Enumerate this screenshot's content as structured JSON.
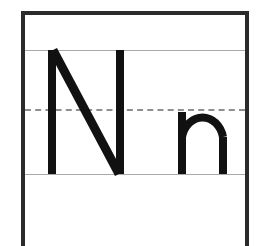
{
  "worksheet": {
    "type": "handwriting-practice-card",
    "letter_name": "N",
    "letters": [
      {
        "glyph": "N",
        "case": "uppercase",
        "label": "capital-N",
        "x_start": 48,
        "x_end": 124,
        "top": 50,
        "bottom": 174,
        "stroke_width": 8,
        "stroke_color": "#111111"
      },
      {
        "glyph": "n",
        "case": "lowercase",
        "label": "lowercase-n",
        "x_start": 178,
        "x_end": 227,
        "top": 110,
        "bottom": 174,
        "stroke_width": 8,
        "stroke_color": "#111111"
      }
    ],
    "guide_lines": [
      {
        "name": "cap-line",
        "style": "solid",
        "y": 50,
        "color": "#a9a9a9"
      },
      {
        "name": "mid-line",
        "style": "dashed",
        "y": 110,
        "color": "#8f8f8f"
      },
      {
        "name": "base-line",
        "style": "solid",
        "y": 174,
        "color": "#a9a9a9"
      }
    ],
    "frame": {
      "color": "#2b2b2b",
      "thickness": 4,
      "left": 21,
      "right": 249,
      "top": 11
    },
    "background": "#ffffff"
  }
}
